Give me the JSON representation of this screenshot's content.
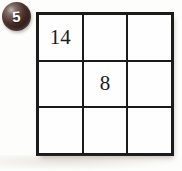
{
  "problem": {
    "number": "5"
  },
  "grid": {
    "rows": 3,
    "cols": 3,
    "cells": [
      [
        "14",
        "",
        ""
      ],
      [
        "",
        "8",
        ""
      ],
      [
        "",
        "",
        ""
      ]
    ]
  },
  "colors": {
    "page_background": "#fdfdfb",
    "grid_line": "#1b1b1b",
    "cell_background": "#fefefe",
    "badge_dark": "#2a1513",
    "badge_highlight": "#c0b7b4",
    "badge_text": "#ffffff",
    "number_text": "#1c1c1c"
  }
}
